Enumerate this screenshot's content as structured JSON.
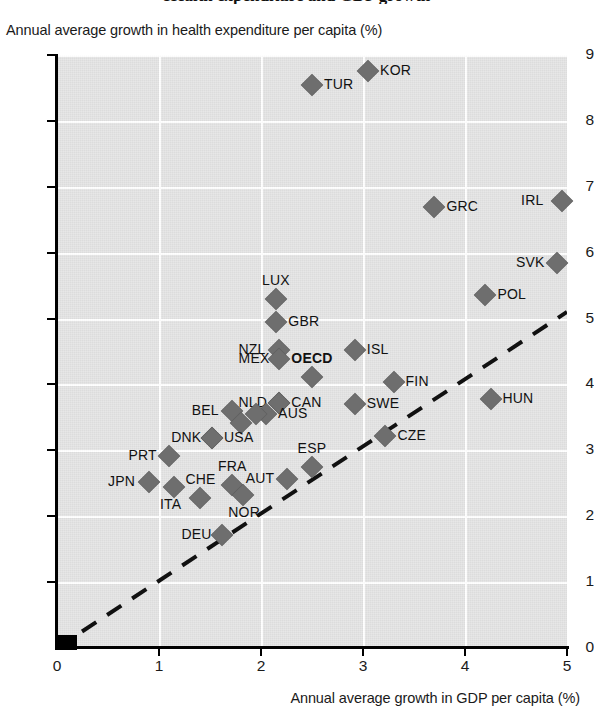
{
  "title": "Health expenditure and GDP growth",
  "axes": {
    "ylabel": "Annual average growth in health expenditure per capita (%)",
    "xlabel": "Annual average growth in GDP per capita (%)",
    "yticks": [
      "0",
      "1",
      "2",
      "3",
      "4",
      "5",
      "6",
      "7",
      "8",
      "9"
    ],
    "xticks": [
      "0",
      "1",
      "2",
      "3",
      "4",
      "5"
    ]
  },
  "chart_data": {
    "type": "scatter",
    "title": "Health expenditure and GDP growth",
    "xlabel": "Annual average growth in GDP per capita (%)",
    "ylabel": "Annual average growth in health expenditure per capita (%)",
    "xlim": [
      0,
      5
    ],
    "ylim": [
      0,
      9
    ],
    "grid": true,
    "legend": "none",
    "annotations": [
      {
        "type": "line",
        "style": "dashed",
        "description": "45-degree reference line from origin",
        "x": [
          0,
          5
        ],
        "y": [
          0,
          5.1
        ]
      }
    ],
    "points": [
      {
        "label": "KOR",
        "x": 3.05,
        "y": 8.75,
        "label_pos": "right"
      },
      {
        "label": "TUR",
        "x": 2.5,
        "y": 8.55,
        "label_pos": "right"
      },
      {
        "label": "IRL",
        "x": 4.95,
        "y": 6.78,
        "label_pos": "left"
      },
      {
        "label": "GRC",
        "x": 3.7,
        "y": 6.7,
        "label_pos": "right"
      },
      {
        "label": "SVK",
        "x": 4.9,
        "y": 5.85,
        "label_pos": "left"
      },
      {
        "label": "POL",
        "x": 4.2,
        "y": 5.35,
        "label_pos": "right"
      },
      {
        "label": "LUX",
        "x": 2.15,
        "y": 5.3,
        "label_pos": "above"
      },
      {
        "label": "GBR",
        "x": 2.15,
        "y": 4.95,
        "label_pos": "right"
      },
      {
        "label": "NZL",
        "x": 2.18,
        "y": 4.53,
        "label_pos": "left"
      },
      {
        "label": "ISL",
        "x": 2.92,
        "y": 4.53,
        "label_pos": "right"
      },
      {
        "label": "MEX",
        "x": 2.18,
        "y": 4.38,
        "label_pos": "left"
      },
      {
        "label": "OECD",
        "x": 2.5,
        "y": 4.12,
        "label_pos": "above",
        "bold": true
      },
      {
        "label": "FIN",
        "x": 3.3,
        "y": 4.03,
        "label_pos": "right"
      },
      {
        "label": "HUN",
        "x": 4.25,
        "y": 3.78,
        "label_pos": "right"
      },
      {
        "label": "CAN",
        "x": 2.18,
        "y": 3.72,
        "label_pos": "right"
      },
      {
        "label": "NLD",
        "x": 2.18,
        "y": 3.72,
        "label_pos": "left"
      },
      {
        "label": "SWE",
        "x": 2.92,
        "y": 3.7,
        "label_pos": "right"
      },
      {
        "label": "BEL",
        "x": 1.72,
        "y": 3.6,
        "label_pos": "left"
      },
      {
        "label": "AUS",
        "x": 2.05,
        "y": 3.55,
        "label_pos": "right"
      },
      {
        "label": "",
        "x": 1.95,
        "y": 3.55,
        "label_pos": "none"
      },
      {
        "label": "",
        "x": 1.8,
        "y": 3.42,
        "label_pos": "none"
      },
      {
        "label": "DNK",
        "x": 1.52,
        "y": 3.18,
        "label_pos": "left"
      },
      {
        "label": "USA",
        "x": 1.52,
        "y": 3.18,
        "label_pos": "right"
      },
      {
        "label": "CZE",
        "x": 3.22,
        "y": 3.22,
        "label_pos": "right"
      },
      {
        "label": "PRT",
        "x": 1.1,
        "y": 2.92,
        "label_pos": "left"
      },
      {
        "label": "ESP",
        "x": 2.5,
        "y": 2.75,
        "label_pos": "above"
      },
      {
        "label": "JPN",
        "x": 0.9,
        "y": 2.52,
        "label_pos": "left"
      },
      {
        "label": "AUT",
        "x": 2.25,
        "y": 2.57,
        "label_pos": "left"
      },
      {
        "label": "FRA",
        "x": 1.72,
        "y": 2.48,
        "label_pos": "above"
      },
      {
        "label": "ITA",
        "x": 1.15,
        "y": 2.45,
        "label_pos": "below"
      },
      {
        "label": "CHE",
        "x": 1.4,
        "y": 2.28,
        "label_pos": "above"
      },
      {
        "label": "NOR",
        "x": 1.82,
        "y": 2.32,
        "label_pos": "below"
      },
      {
        "label": "DEU",
        "x": 1.62,
        "y": 1.72,
        "label_pos": "left"
      }
    ]
  }
}
